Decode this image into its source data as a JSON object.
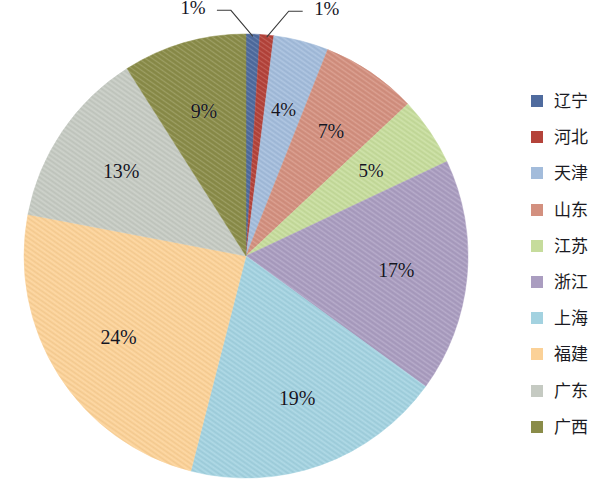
{
  "chart_data": {
    "type": "pie",
    "title": "",
    "subtitle": "",
    "xlabel": "",
    "ylabel": "",
    "grid": false,
    "legend_position": "right",
    "start_angle_deg": 0,
    "direction": "clockwise",
    "categories": [
      "辽宁",
      "河北",
      "天津",
      "山东",
      "江苏",
      "浙江",
      "上海",
      "福建",
      "广东",
      "广西"
    ],
    "values": [
      1,
      1,
      4,
      7,
      5,
      17,
      19,
      24,
      13,
      9
    ],
    "value_labels": [
      "1%",
      "1%",
      "4%",
      "7%",
      "5%",
      "17%",
      "19%",
      "24%",
      "13%",
      "9%"
    ],
    "colors": [
      "#4f6b9e",
      "#b4433a",
      "#a3bcdb",
      "#d3907f",
      "#c6dc9c",
      "#aa9dc0",
      "#a3d2e0",
      "#fbd197",
      "#c5cac2",
      "#8a8c49"
    ],
    "slices": [
      {
        "label": "辽宁",
        "value": 1,
        "value_label": "1%",
        "color": "#4f6b9e",
        "leader": true
      },
      {
        "label": "河北",
        "value": 1,
        "value_label": "1%",
        "color": "#b4433a",
        "leader": true
      },
      {
        "label": "天津",
        "value": 4,
        "value_label": "4%",
        "color": "#a3bcdb",
        "leader": false
      },
      {
        "label": "山东",
        "value": 7,
        "value_label": "7%",
        "color": "#d3907f",
        "leader": false
      },
      {
        "label": "江苏",
        "value": 5,
        "value_label": "5%",
        "color": "#c6dc9c",
        "leader": false
      },
      {
        "label": "浙江",
        "value": 17,
        "value_label": "17%",
        "color": "#aa9dc0",
        "leader": false
      },
      {
        "label": "上海",
        "value": 19,
        "value_label": "19%",
        "color": "#a3d2e0",
        "leader": false
      },
      {
        "label": "福建",
        "value": 24,
        "value_label": "24%",
        "color": "#fbd197",
        "leader": false
      },
      {
        "label": "广东",
        "value": 13,
        "value_label": "13%",
        "color": "#c5cac2",
        "leader": false
      },
      {
        "label": "广西",
        "value": 9,
        "value_label": "9%",
        "color": "#8a8c49",
        "leader": false
      }
    ]
  },
  "legend": {
    "items": [
      {
        "label": "辽宁",
        "color": "#4f6b9e"
      },
      {
        "label": "河北",
        "color": "#b4433a"
      },
      {
        "label": "天津",
        "color": "#a3bcdb"
      },
      {
        "label": "山东",
        "color": "#d3907f"
      },
      {
        "label": "江苏",
        "color": "#c6dc9c"
      },
      {
        "label": "浙江",
        "color": "#aa9dc0"
      },
      {
        "label": "上海",
        "color": "#a3d2e0"
      },
      {
        "label": "福建",
        "color": "#fbd197"
      },
      {
        "label": "广东",
        "color": "#c5cac2"
      },
      {
        "label": "广西",
        "color": "#8a8c49"
      }
    ]
  },
  "geometry": {
    "center_x": 246,
    "center_y": 256,
    "radius": 222,
    "label_radius_factor": 0.68
  }
}
